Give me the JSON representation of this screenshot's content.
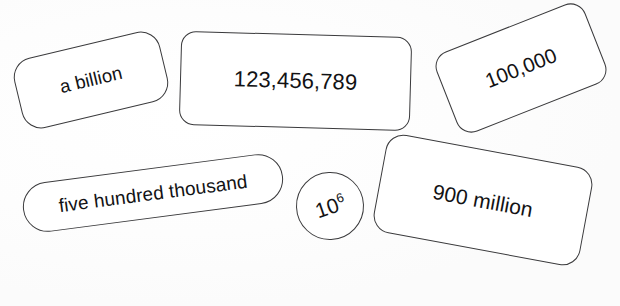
{
  "sheet": {
    "title": "Large number representation cards",
    "background_color": "#ffffff",
    "stroke_color": "#3a3a3c",
    "text_color": "#121214",
    "width": 620,
    "height": 306
  },
  "cards": [
    {
      "id": "a-billion",
      "label": "a billion",
      "shape": "rounded-rectangle",
      "rotation_deg": -13.5,
      "numeric_value": 1000000000
    },
    {
      "id": "123456789",
      "label": "123,456,789",
      "shape": "rounded-rectangle",
      "rotation_deg": 1.6,
      "numeric_value": 123456789
    },
    {
      "id": "100000",
      "label": "100,000",
      "shape": "rounded-rectangle",
      "rotation_deg": -21.5,
      "numeric_value": 100000
    },
    {
      "id": "five-hundred-thousand",
      "label": "five hundred thousand",
      "shape": "stadium",
      "rotation_deg": -7.5,
      "numeric_value": 500000
    },
    {
      "id": "ten-to-sixth",
      "label": "10",
      "exponent": "6",
      "shape": "circle",
      "rotation_deg": -2,
      "numeric_value": 1000000
    },
    {
      "id": "900-million",
      "label": "900 million",
      "shape": "rounded-rectangle",
      "rotation_deg": 10.5,
      "numeric_value": 900000000
    }
  ]
}
